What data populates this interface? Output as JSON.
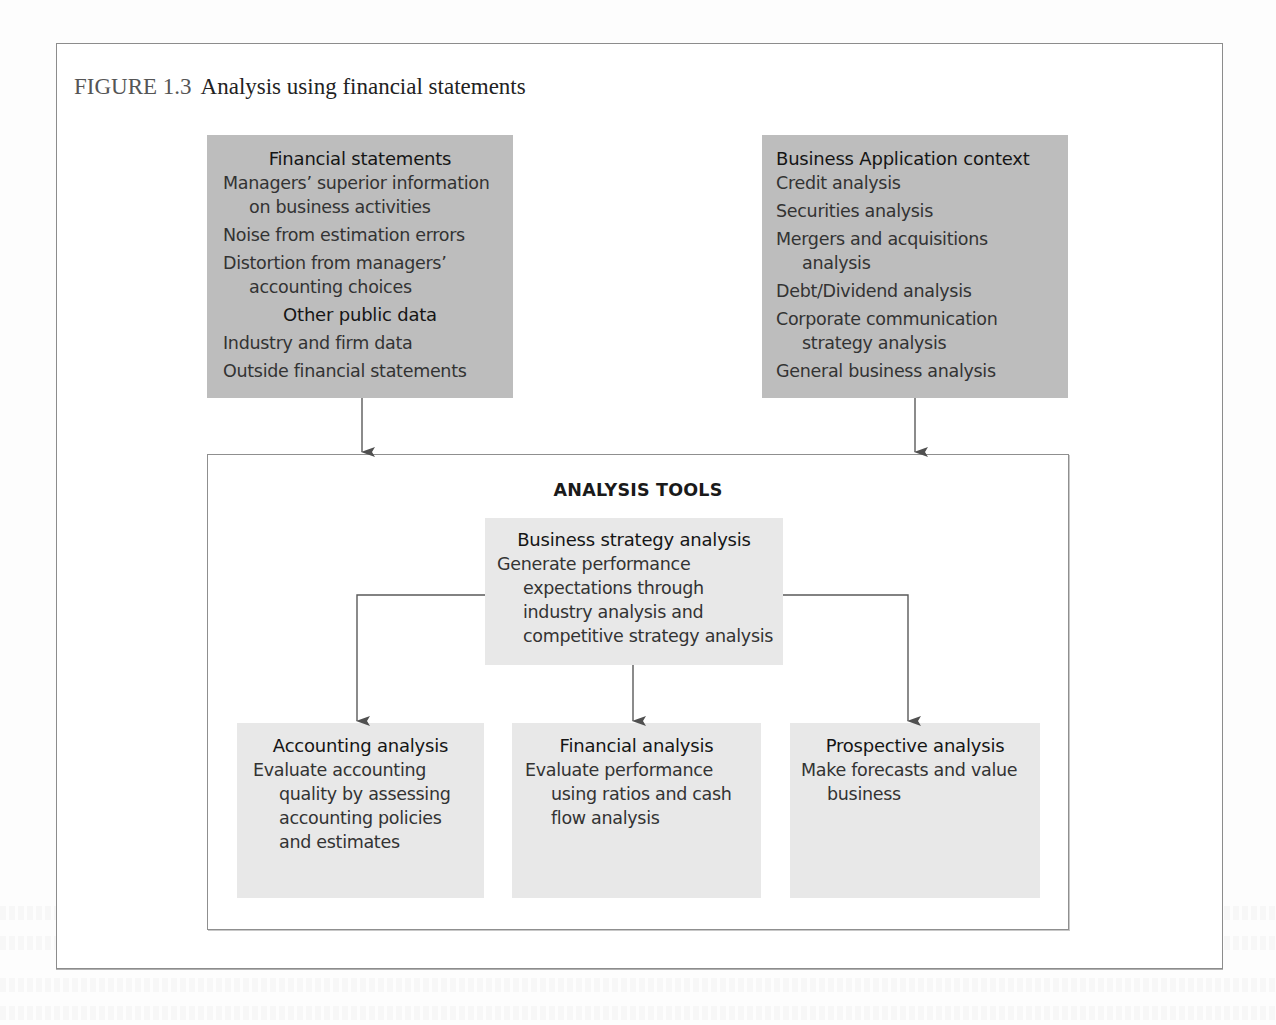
{
  "figure": {
    "number": "FIGURE 1.3",
    "title": "Analysis using financial statements"
  },
  "inputs": {
    "left": {
      "heading": "Financial statements",
      "items": [
        {
          "text": "Managers’ superior information",
          "indent": false
        },
        {
          "text": "on business activities",
          "indent": true
        },
        {
          "text": "Noise from estimation errors",
          "indent": false
        },
        {
          "text": "Distortion from managers’",
          "indent": false
        },
        {
          "text": "accounting choices",
          "indent": true
        }
      ],
      "subheading": "Other public data",
      "subitems": [
        {
          "text": "Industry and firm data",
          "indent": false
        },
        {
          "text": "Outside financial statements",
          "indent": false
        }
      ]
    },
    "right": {
      "heading": "Business Application context",
      "items": [
        {
          "text": "Credit analysis",
          "indent": false
        },
        {
          "text": "Securities analysis",
          "indent": false
        },
        {
          "text": "Mergers and acquisitions",
          "indent": false
        },
        {
          "text": "analysis",
          "indent": true
        },
        {
          "text": "Debt/Dividend analysis",
          "indent": false
        },
        {
          "text": "Corporate communication",
          "indent": false
        },
        {
          "text": "strategy analysis",
          "indent": true
        },
        {
          "text": "General business analysis",
          "indent": false
        }
      ]
    }
  },
  "tools": {
    "title": "ANALYSIS TOOLS",
    "strategy": {
      "heading": "Business strategy analysis",
      "lines": [
        {
          "text": "Generate performance",
          "indent": false
        },
        {
          "text": "expectations through",
          "indent": true
        },
        {
          "text": "industry analysis and",
          "indent": true
        },
        {
          "text": "competitive strategy analysis",
          "indent": true
        }
      ]
    },
    "outputs": [
      {
        "heading": "Accounting analysis",
        "lines": [
          {
            "text": "Evaluate accounting",
            "indent": false
          },
          {
            "text": "quality by assessing",
            "indent": true
          },
          {
            "text": "accounting policies",
            "indent": true
          },
          {
            "text": "and estimates",
            "indent": true
          }
        ]
      },
      {
        "heading": "Financial analysis",
        "lines": [
          {
            "text": "Evaluate performance",
            "indent": false
          },
          {
            "text": "using ratios and cash",
            "indent": true
          },
          {
            "text": "flow analysis",
            "indent": true
          }
        ]
      },
      {
        "heading": "Prospective analysis",
        "lines": [
          {
            "text": "Make forecasts and value",
            "indent": false
          },
          {
            "text": "business",
            "indent": true
          }
        ]
      }
    ]
  },
  "colors": {
    "input_box": "#bdbdbd",
    "tool_box": "#e8e8e8",
    "frame_border": "#8c8c8c",
    "arrow": "#505050"
  }
}
